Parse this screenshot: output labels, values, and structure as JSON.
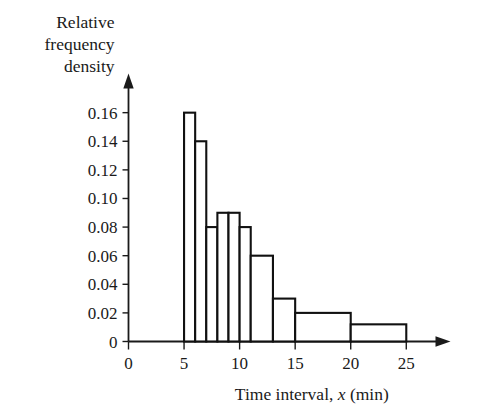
{
  "chart_data": {
    "type": "bar",
    "title": "",
    "subtitle": "",
    "xlabel": "Time interval, x (min)",
    "ylabel": "Relative frequency density",
    "xlabel_prefix": "Time interval, ",
    "xlabel_variable": "x",
    "xlabel_suffix": " (min)",
    "ylabel_lines": [
      "Relative",
      "frequency",
      "density"
    ],
    "xlim": [
      0,
      27
    ],
    "ylim": [
      0,
      0.172
    ],
    "grid": false,
    "legend": false,
    "legend_position": "none",
    "x_tick_labels": [
      "0",
      "5",
      "10",
      "15",
      "20",
      "25"
    ],
    "x_tick_values": [
      0,
      5,
      10,
      15,
      20,
      25
    ],
    "x_minor_tick_values": [
      6,
      7,
      8,
      9,
      11,
      13
    ],
    "y_tick_labels": [
      "0",
      "0.02",
      "0.04",
      "0.06",
      "0.08",
      "0.10",
      "0.12",
      "0.14",
      "0.16"
    ],
    "y_tick_values": [
      0,
      0.02,
      0.04,
      0.06,
      0.08,
      0.1,
      0.12,
      0.14,
      0.16
    ],
    "bars": [
      {
        "label": "5-6",
        "x_start": 5,
        "x_end": 6,
        "value": 0.16
      },
      {
        "label": "6-7",
        "x_start": 6,
        "x_end": 7,
        "value": 0.14
      },
      {
        "label": "7-8",
        "x_start": 7,
        "x_end": 8,
        "value": 0.08
      },
      {
        "label": "8-9",
        "x_start": 8,
        "x_end": 9,
        "value": 0.09
      },
      {
        "label": "9-10",
        "x_start": 9,
        "x_end": 10,
        "value": 0.09
      },
      {
        "label": "10-11",
        "x_start": 10,
        "x_end": 11,
        "value": 0.08
      },
      {
        "label": "11-13",
        "x_start": 11,
        "x_end": 13,
        "value": 0.06
      },
      {
        "label": "13-15",
        "x_start": 13,
        "x_end": 15,
        "value": 0.03
      },
      {
        "label": "15-20",
        "x_start": 15,
        "x_end": 20,
        "value": 0.02
      },
      {
        "label": "20-25",
        "x_start": 20,
        "x_end": 25,
        "value": 0.012
      }
    ],
    "axis_arrows": {
      "x": true,
      "y": true
    }
  },
  "colors": {
    "background": "#ffffff",
    "ink": "#1a1a1a",
    "bar_stroke": "#111111",
    "bar_fill": "#ffffff"
  }
}
